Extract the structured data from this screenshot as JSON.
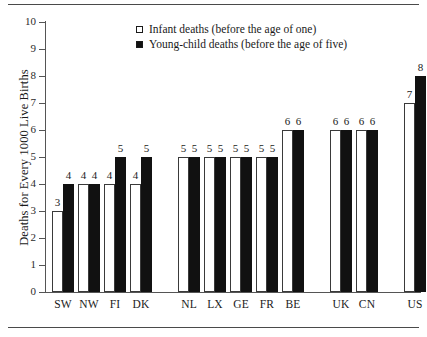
{
  "chart_data": {
    "type": "bar",
    "title": "",
    "subtitle": "",
    "xlabel": "",
    "ylabel": "Deaths for Every 1000 Live Births",
    "ylim": [
      0,
      10
    ],
    "ytick_labels": [
      "0",
      "1",
      "2",
      "3",
      "4",
      "5",
      "6",
      "7",
      "8",
      "9",
      "10"
    ],
    "ytick_values": [
      0,
      1,
      2,
      3,
      4,
      5,
      6,
      7,
      8,
      9,
      10
    ],
    "grid": false,
    "legend_position": "top-center",
    "categories": [
      "SW",
      "NW",
      "FI",
      "DK",
      "NL",
      "LX",
      "GE",
      "FR",
      "BE",
      "UK",
      "CN",
      "US"
    ],
    "groups": [
      {
        "name": "group-1",
        "categories": [
          "SW",
          "NW",
          "FI",
          "DK"
        ]
      },
      {
        "name": "group-2",
        "categories": [
          "NL",
          "LX",
          "GE",
          "FR",
          "BE"
        ]
      },
      {
        "name": "group-3",
        "categories": [
          "UK",
          "CN"
        ]
      },
      {
        "name": "group-4",
        "categories": [
          "US"
        ]
      }
    ],
    "series": [
      {
        "name": "Infant deaths (before the age of one)",
        "marker": "open-square",
        "color": "#ffffff",
        "values": [
          3,
          4,
          4,
          4,
          5,
          5,
          5,
          5,
          6,
          6,
          6,
          7
        ]
      },
      {
        "name": "Young-child deaths (before the age of five)",
        "marker": "filled-square",
        "color": "#111111",
        "values": [
          4,
          4,
          5,
          5,
          5,
          5,
          5,
          5,
          6,
          6,
          6,
          8
        ]
      }
    ],
    "data_labels": [
      {
        "category": "SW",
        "infant": "3",
        "child": "4"
      },
      {
        "category": "NW",
        "infant": "4",
        "child": "4"
      },
      {
        "category": "FI",
        "infant": "4",
        "child": "5"
      },
      {
        "category": "DK",
        "infant": "4",
        "child": "5"
      },
      {
        "category": "NL",
        "infant": "5",
        "child": "5"
      },
      {
        "category": "LX",
        "infant": "5",
        "child": "5"
      },
      {
        "category": "GE",
        "infant": "5",
        "child": "5"
      },
      {
        "category": "FR",
        "infant": "5",
        "child": "5"
      },
      {
        "category": "BE",
        "infant": "6",
        "child": "6"
      },
      {
        "category": "UK",
        "infant": "6",
        "child": "6"
      },
      {
        "category": "CN",
        "infant": "6",
        "child": "6"
      },
      {
        "category": "US",
        "infant": "7",
        "child": "8"
      }
    ]
  },
  "legend": {
    "entries": [
      {
        "label": "Infant deaths (before the age of one)",
        "marker": "open-square"
      },
      {
        "label": "Young-child deaths (before the age of five)",
        "marker": "filled-square"
      }
    ]
  },
  "axis": {
    "y_title": "Deaths for Every 1000 Live Births"
  },
  "colors": {
    "infant_fill": "#ffffff",
    "child_fill": "#111111",
    "axis": "#555555",
    "text": "#1a1a1a",
    "rule": "#4a4a4a",
    "background": "#ffffff"
  }
}
